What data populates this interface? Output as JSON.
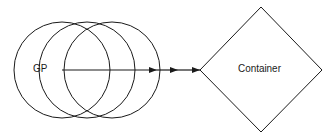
{
  "diagram": {
    "source_node": {
      "label": "GP",
      "shape": "circle",
      "copies": 3
    },
    "target_node": {
      "label": "Container",
      "shape": "diamond"
    },
    "edge": {
      "from": "GP",
      "to": "Container",
      "arrowheads": 3
    },
    "colors": {
      "stroke": "#1a1a1a",
      "background": "#ffffff"
    }
  }
}
